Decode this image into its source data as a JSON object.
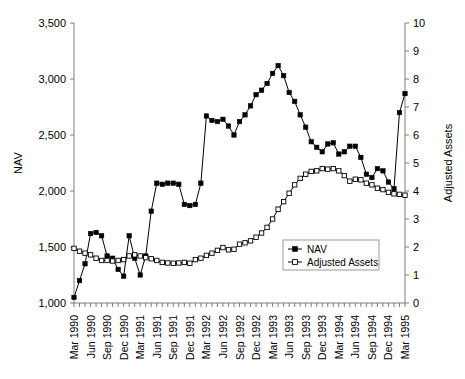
{
  "chart_data": {
    "type": "line",
    "title": "",
    "xlabel": "",
    "ylabel": "NAV",
    "y2label": "Adjusted Assets",
    "ylim": [
      1000,
      3500
    ],
    "y2lim": [
      0,
      10
    ],
    "ytick_labels": [
      "3,500",
      "3,000",
      "2,500",
      "2,000",
      "1,500",
      "1,000"
    ],
    "ytick_values": [
      3500,
      3000,
      2500,
      2000,
      1500,
      1000
    ],
    "y2tick_labels": [
      "10",
      "9",
      "8",
      "7",
      "6",
      "5",
      "4",
      "3",
      "2",
      "1",
      "0"
    ],
    "y2tick_values": [
      10,
      9,
      8,
      7,
      6,
      5,
      4,
      3,
      2,
      1,
      0
    ],
    "grid": false,
    "legend_position": "inside-bottom-right",
    "x_tick_labels": [
      "Mar 1990",
      "Jun 1990",
      "Sep 1990",
      "Dec 1990",
      "Mar 1991",
      "Jun 1991",
      "Sep 1991",
      "Dec 1991",
      "Mar 1992",
      "Jun 1992",
      "Sep 1992",
      "Dec 1992",
      "Mar 1993",
      "Jun 1993",
      "Sep 1993",
      "Dec 1993",
      "Mar 1994",
      "Jun 1994",
      "Sep 1994",
      "Dec 1994",
      "Mar 1995"
    ],
    "x_tick_indices": [
      0,
      3,
      6,
      9,
      12,
      15,
      18,
      21,
      24,
      27,
      30,
      33,
      36,
      39,
      42,
      45,
      48,
      51,
      54,
      57,
      60
    ],
    "x": [
      "Mar 1990",
      "Apr 1990",
      "May 1990",
      "Jun 1990",
      "Jul 1990",
      "Aug 1990",
      "Sep 1990",
      "Oct 1990",
      "Nov 1990",
      "Dec 1990",
      "Jan 1991",
      "Feb 1991",
      "Mar 1991",
      "Apr 1991",
      "May 1991",
      "Jun 1991",
      "Jul 1991",
      "Aug 1991",
      "Sep 1991",
      "Oct 1991",
      "Nov 1991",
      "Dec 1991",
      "Jan 1992",
      "Feb 1992",
      "Mar 1992",
      "Apr 1992",
      "May 1992",
      "Jun 1992",
      "Jul 1992",
      "Aug 1992",
      "Sep 1992",
      "Oct 1992",
      "Nov 1992",
      "Dec 1992",
      "Jan 1993",
      "Feb 1993",
      "Mar 1993",
      "Apr 1993",
      "May 1993",
      "Jun 1993",
      "Jul 1993",
      "Aug 1993",
      "Sep 1993",
      "Oct 1993",
      "Nov 1993",
      "Dec 1993",
      "Jan 1994",
      "Feb 1994",
      "Mar 1994",
      "Apr 1994",
      "May 1994",
      "Jun 1994",
      "Jul 1994",
      "Aug 1994",
      "Sep 1994",
      "Oct 1994",
      "Nov 1994",
      "Dec 1994",
      "Jan 1995",
      "Feb 1995",
      "Mar 1995"
    ],
    "series": [
      {
        "name": "NAV",
        "axis": "left",
        "marker": "filled-square",
        "values": [
          1050,
          1200,
          1350,
          1620,
          1630,
          1600,
          1420,
          1400,
          1300,
          1240,
          1600,
          1400,
          1250,
          1420,
          1820,
          2070,
          2060,
          2070,
          2070,
          2060,
          1880,
          1870,
          1880,
          2070,
          2670,
          2630,
          2620,
          2640,
          2580,
          2500,
          2620,
          2680,
          2760,
          2860,
          2900,
          2960,
          3050,
          3120,
          3030,
          2880,
          2800,
          2680,
          2570,
          2440,
          2390,
          2350,
          2420,
          2430,
          2330,
          2350,
          2400,
          2400,
          2300,
          2150,
          2120,
          2200,
          2180,
          2080,
          2020,
          2700,
          2870
        ]
      },
      {
        "name": "Adjusted Assets",
        "axis": "right",
        "marker": "open-square",
        "values": [
          1.95,
          1.85,
          1.78,
          1.72,
          1.6,
          1.52,
          1.52,
          1.5,
          1.52,
          1.55,
          1.68,
          1.72,
          1.68,
          1.62,
          1.58,
          1.52,
          1.45,
          1.43,
          1.42,
          1.43,
          1.45,
          1.42,
          1.55,
          1.6,
          1.7,
          1.78,
          1.88,
          1.98,
          1.9,
          1.92,
          2.1,
          2.15,
          2.22,
          2.35,
          2.5,
          2.7,
          3.0,
          3.35,
          3.62,
          3.92,
          4.22,
          4.45,
          4.6,
          4.7,
          4.72,
          4.8,
          4.78,
          4.8,
          4.72,
          4.55,
          4.35,
          4.42,
          4.4,
          4.28,
          4.22,
          4.1,
          4.05,
          3.95,
          3.9,
          3.88,
          3.85
        ]
      }
    ]
  },
  "legend": {
    "items": [
      {
        "label": "NAV",
        "marker": "filled-square"
      },
      {
        "label": "Adjusted Assets",
        "marker": "open-square"
      }
    ]
  },
  "axes": {
    "left_title": "NAV",
    "right_title": "Adjusted Assets"
  }
}
